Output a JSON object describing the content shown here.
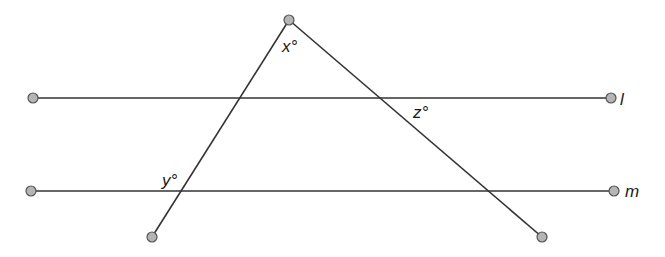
{
  "diagram": {
    "lines": {
      "l": {
        "label": "l",
        "from": [
          33,
          98
        ],
        "to": [
          611,
          98
        ]
      },
      "m": {
        "label": "m",
        "from": [
          31,
          191
        ],
        "to": [
          614,
          191
        ]
      }
    },
    "transversals": [
      {
        "name": "left-transversal",
        "from": [
          289,
          20
        ],
        "to": [
          152,
          237
        ]
      },
      {
        "name": "right-transversal",
        "from": [
          289,
          20
        ],
        "to": [
          542,
          237
        ]
      }
    ],
    "angles": {
      "x": {
        "label": "x°",
        "position": [
          293,
          50
        ]
      },
      "y": {
        "label": "y°",
        "position": [
          173,
          182
        ]
      },
      "z": {
        "label": "z°",
        "position": [
          423,
          116
        ]
      }
    },
    "line_labels": {
      "l": {
        "text": "l",
        "position": [
          621,
          105
        ]
      },
      "m": {
        "text": "m",
        "position": [
          626,
          197
        ]
      }
    }
  }
}
